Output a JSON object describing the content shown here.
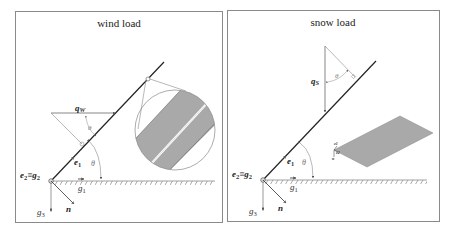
{
  "panels": [
    {
      "id": "wind",
      "title": "wind load",
      "labels": {
        "load_vector": "q",
        "load_sub": "W",
        "angle_top": "θ",
        "angle_base": "θ",
        "e1": "e",
        "e1_sub": "1",
        "e2_g2": "e",
        "e2_sub": "2",
        "equiv": "≡",
        "g2": "g",
        "g2_sub": "2",
        "g1": "g",
        "g1_sub": "1",
        "g3": "g",
        "g3_sub": "3",
        "n": "n"
      },
      "inset": "circular magnified cross-section of inclined plate (two gray layers separated by a thin gap)"
    },
    {
      "id": "snow",
      "title": "snow load",
      "labels": {
        "load_vector": "q",
        "load_sub": "S",
        "angle_top": "θ",
        "angle_base": "θ",
        "e1": "e",
        "e1_sub": "1",
        "e2_g2": "e",
        "e2_sub": "2",
        "equiv": "≡",
        "g2": "g",
        "g2_sub": "2",
        "g1": "g",
        "g1_sub": "1",
        "g3": "g",
        "g3_sub": "3",
        "n": "n",
        "inset_e1": "e1",
        "inset_e2": "e2",
        "inset_n": "n"
      },
      "inset": "gray parallelogram plate in perspective with local basis e1, e2, n"
    }
  ],
  "colors": {
    "frame": "#8a8a8a",
    "line": "#222222",
    "thin": "#777777",
    "plate_fill": "#a9a9a9",
    "ground_hatch": "#888888"
  }
}
